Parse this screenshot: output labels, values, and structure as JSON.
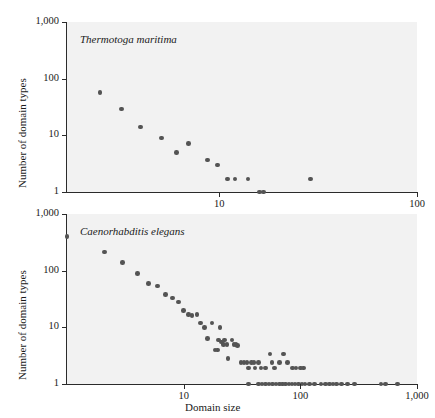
{
  "figure": {
    "background": "#ffffff",
    "plot_background": "#f2f2f2",
    "marker_color": "#545454",
    "axis_color": "#2b2b2b"
  },
  "axis_titles": {
    "x": "Domain size",
    "y_top": "Number of domain types",
    "y_bottom": "Number of domain types"
  },
  "chart_data": [
    {
      "type": "scatter",
      "title": "Thermotoga maritima",
      "panel": "top",
      "xlabel": "",
      "ylabel": "Number of domain types",
      "xscale": "log",
      "yscale": "log",
      "xlim": [
        1.7,
        100
      ],
      "ylim": [
        1,
        1000
      ],
      "xticks": [
        10,
        100
      ],
      "xtick_labels": [
        "10",
        "100"
      ],
      "yticks": [
        1,
        10,
        100,
        1000
      ],
      "ytick_labels": [
        "1",
        "10",
        "100",
        "1,000"
      ],
      "grid": false,
      "legend": "none",
      "points": [
        {
          "x": 2.5,
          "y": 57
        },
        {
          "x": 3.2,
          "y": 29
        },
        {
          "x": 4.0,
          "y": 14
        },
        {
          "x": 5.1,
          "y": 9
        },
        {
          "x": 6.1,
          "y": 5
        },
        {
          "x": 7.0,
          "y": 7.2
        },
        {
          "x": 8.7,
          "y": 3.7
        },
        {
          "x": 9.8,
          "y": 3
        },
        {
          "x": 11.0,
          "y": 1.7
        },
        {
          "x": 12.0,
          "y": 1.7
        },
        {
          "x": 14.0,
          "y": 1.7
        },
        {
          "x": 16.0,
          "y": 1
        },
        {
          "x": 16.8,
          "y": 1
        },
        {
          "x": 29.0,
          "y": 1.7
        }
      ]
    },
    {
      "type": "scatter",
      "title": "Caenorhabditis elegans",
      "panel": "bottom",
      "xlabel": "Domain size",
      "ylabel": "Number of domain types",
      "xscale": "log",
      "yscale": "log",
      "xlim": [
        1.0,
        1000
      ],
      "ylim": [
        1,
        1000
      ],
      "xticks": [
        10,
        100,
        1000
      ],
      "xtick_labels": [
        "10",
        "100",
        "1,000"
      ],
      "yticks": [
        1,
        10,
        100,
        1000
      ],
      "ytick_labels": [
        "1",
        "10",
        "100",
        "1,000"
      ],
      "grid": false,
      "legend": "none",
      "points": [
        {
          "x": 1.0,
          "y": 400
        },
        {
          "x": 2.1,
          "y": 215
        },
        {
          "x": 3.0,
          "y": 140
        },
        {
          "x": 4.0,
          "y": 90
        },
        {
          "x": 5.0,
          "y": 60
        },
        {
          "x": 6.0,
          "y": 54
        },
        {
          "x": 7.0,
          "y": 38
        },
        {
          "x": 8.0,
          "y": 33
        },
        {
          "x": 9.0,
          "y": 28
        },
        {
          "x": 10.0,
          "y": 20
        },
        {
          "x": 11.0,
          "y": 17
        },
        {
          "x": 11.8,
          "y": 16
        },
        {
          "x": 13.0,
          "y": 17
        },
        {
          "x": 14.0,
          "y": 12
        },
        {
          "x": 15.0,
          "y": 10
        },
        {
          "x": 16.0,
          "y": 6.3
        },
        {
          "x": 17.5,
          "y": 12
        },
        {
          "x": 18.5,
          "y": 4
        },
        {
          "x": 19.5,
          "y": 4
        },
        {
          "x": 20.5,
          "y": 10
        },
        {
          "x": 20.0,
          "y": 6
        },
        {
          "x": 21.0,
          "y": 5.5
        },
        {
          "x": 22.0,
          "y": 5
        },
        {
          "x": 22.5,
          "y": 6
        },
        {
          "x": 23.5,
          "y": 5
        },
        {
          "x": 24.0,
          "y": 2.8
        },
        {
          "x": 26.0,
          "y": 6
        },
        {
          "x": 27.0,
          "y": 5
        },
        {
          "x": 28.0,
          "y": 5
        },
        {
          "x": 29.0,
          "y": 4.8
        },
        {
          "x": 31.0,
          "y": 2.4
        },
        {
          "x": 33.0,
          "y": 2.4
        },
        {
          "x": 35.0,
          "y": 2.4
        },
        {
          "x": 36.0,
          "y": 1.9
        },
        {
          "x": 38.0,
          "y": 2.4
        },
        {
          "x": 40.0,
          "y": 2.4
        },
        {
          "x": 41.0,
          "y": 1.9
        },
        {
          "x": 44.0,
          "y": 2.4
        },
        {
          "x": 46.0,
          "y": 1.9
        },
        {
          "x": 50.0,
          "y": 1.9
        },
        {
          "x": 55.0,
          "y": 3.4
        },
        {
          "x": 57.0,
          "y": 2.4
        },
        {
          "x": 60.0,
          "y": 1.9
        },
        {
          "x": 66.0,
          "y": 2.4
        },
        {
          "x": 72.0,
          "y": 3.4
        },
        {
          "x": 78.0,
          "y": 2.4
        },
        {
          "x": 86.0,
          "y": 1.9
        },
        {
          "x": 92.0,
          "y": 1.9
        },
        {
          "x": 100.0,
          "y": 1.9
        },
        {
          "x": 107.0,
          "y": 1.9
        },
        {
          "x": 36.0,
          "y": 1
        },
        {
          "x": 44.0,
          "y": 1
        },
        {
          "x": 47.0,
          "y": 1
        },
        {
          "x": 50.0,
          "y": 1
        },
        {
          "x": 54.0,
          "y": 1
        },
        {
          "x": 58.0,
          "y": 1
        },
        {
          "x": 62.0,
          "y": 1
        },
        {
          "x": 66.0,
          "y": 1
        },
        {
          "x": 70.0,
          "y": 1
        },
        {
          "x": 75.0,
          "y": 1
        },
        {
          "x": 80.0,
          "y": 1
        },
        {
          "x": 85.0,
          "y": 1
        },
        {
          "x": 90.0,
          "y": 1
        },
        {
          "x": 96.0,
          "y": 1
        },
        {
          "x": 103.0,
          "y": 1
        },
        {
          "x": 110.0,
          "y": 1
        },
        {
          "x": 120.0,
          "y": 1
        },
        {
          "x": 132.0,
          "y": 1
        },
        {
          "x": 150.0,
          "y": 1
        },
        {
          "x": 165.0,
          "y": 1
        },
        {
          "x": 178.0,
          "y": 1
        },
        {
          "x": 190.0,
          "y": 1
        },
        {
          "x": 205.0,
          "y": 1
        },
        {
          "x": 225.0,
          "y": 1
        },
        {
          "x": 255.0,
          "y": 1
        },
        {
          "x": 290.0,
          "y": 1
        },
        {
          "x": 490.0,
          "y": 1
        },
        {
          "x": 540.0,
          "y": 1
        },
        {
          "x": 680.0,
          "y": 1
        }
      ]
    }
  ]
}
